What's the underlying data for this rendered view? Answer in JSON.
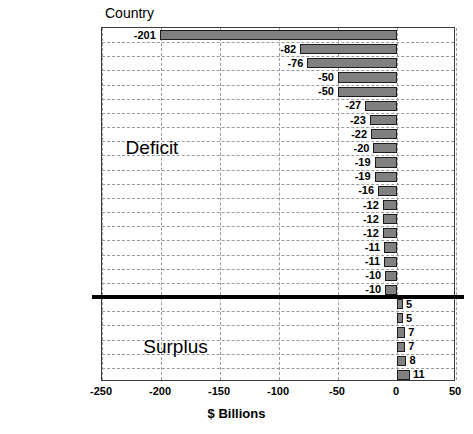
{
  "chart_data": {
    "type": "bar",
    "orientation": "horizontal",
    "title": "",
    "xlabel": "$ Billions",
    "ylabel": "Country",
    "xlim": [
      -250,
      50
    ],
    "xticks": [
      -250,
      -200,
      -150,
      -100,
      -50,
      0,
      50
    ],
    "xtick_labels": [
      "-250",
      "-200",
      "-150",
      "-100",
      "-50",
      "0",
      "50"
    ],
    "grid": true,
    "legend": "none",
    "categories": [
      "China",
      "Japan",
      "Canada",
      "Germany",
      "Mexico",
      "Venezuela",
      "Malaysia",
      "Nigeria",
      "Saudi Arabia",
      "Italy",
      "Ireland",
      "South Korea",
      "Taiwan",
      "Thailand",
      "United Kingdom",
      "France",
      "Russia",
      "India",
      "Sweden",
      "Singapore",
      "Belgium",
      "United Arab Emirates",
      "Hong Kong",
      "Australia",
      "Netherlands"
    ],
    "values": [
      -201,
      -82,
      -76,
      -50,
      -50,
      -27,
      -23,
      -22,
      -20,
      -19,
      -19,
      -16,
      -12,
      -12,
      -12,
      -11,
      -11,
      -10,
      -10,
      5,
      5,
      7,
      7,
      8,
      11
    ],
    "data_labels": [
      "-201",
      "-82",
      "-76",
      "-50",
      "-50",
      "-27",
      "-23",
      "-22",
      "-20",
      "-19",
      "-19",
      "-16",
      "-12",
      "-12",
      "-12",
      "-11",
      "-11",
      "-10",
      "-10",
      "5",
      "5",
      "7",
      "7",
      "8",
      "11"
    ],
    "annotations": [
      {
        "text": "Deficit",
        "x": -230,
        "category": "Saudi Arabia"
      },
      {
        "text": "Surplus",
        "x": -215,
        "category": "Hong Kong"
      }
    ],
    "divider": {
      "after_category": "Sweden",
      "style": "thick-black-line"
    },
    "colors": {
      "bar_fill": "#808080",
      "bar_edge": "#1c1c1c",
      "grid": "#9a9a9a",
      "axis": "#3a3a3a",
      "text": "#000000",
      "background": "#ffffff"
    }
  }
}
